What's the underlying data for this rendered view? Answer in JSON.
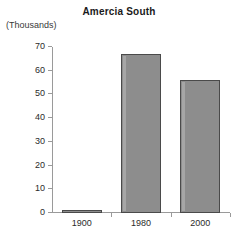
{
  "chart_data": {
    "type": "bar",
    "title": "Amercia South",
    "xlabel": "",
    "ylabel": "(Thousands)",
    "categories": [
      "1900",
      "1980",
      "2000"
    ],
    "values": [
      1,
      67,
      56
    ],
    "ylim": [
      0,
      70
    ],
    "yticks": [
      0,
      10,
      20,
      30,
      40,
      50,
      60,
      70
    ],
    "ytick_labels": [
      "0",
      "10",
      "20",
      "30",
      "40",
      "50",
      "60",
      "70"
    ],
    "grid": false,
    "legend": null,
    "bar_color": "#8d8d8d",
    "bar_edge_color": "#4a4a4a",
    "axis_color": "#9a9a9a",
    "text_color": "#2b2b2b"
  }
}
